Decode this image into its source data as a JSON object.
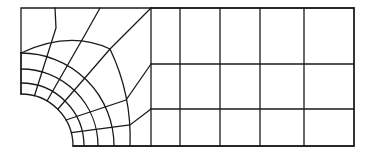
{
  "diagram": {
    "type": "finite-element-mesh",
    "stroke_color": "#1a1a1a",
    "background": "#ffffff",
    "bounds": {
      "left": 21,
      "top": 8,
      "right": 354,
      "bottom": 146
    },
    "hole_center": [
      21,
      146
    ],
    "hole_radius": 52,
    "arc_radii": [
      52,
      63,
      77,
      93
    ],
    "radial_angles_deg": [
      0,
      15,
      30,
      45,
      60,
      75,
      90
    ],
    "transition_column_x": 151,
    "right_grid": {
      "x_lines": [
        151,
        180,
        220,
        260,
        304,
        354
      ],
      "y_lines": [
        8,
        64,
        109,
        146
      ]
    },
    "outer_corner_node": [
      110,
      49
    ]
  }
}
